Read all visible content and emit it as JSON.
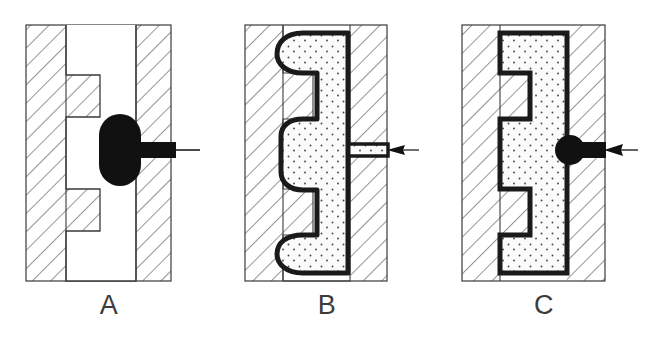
{
  "figure": {
    "title": "Injection molding cavity filling sequence",
    "width": 653,
    "height": 338,
    "background_color": "#ffffff",
    "panel_count": 3
  },
  "style": {
    "outline_color": "#1a1a1a",
    "mold_hatch_color": "#555555",
    "mold_fill_color": "#ffffff",
    "cavity_fill_color": "#ffffff",
    "melt_solid_color": "#111111",
    "part_fill_color": "#fbfbfb",
    "stipple_color": "#4a4a4a",
    "caption_color": "#3c3c3c",
    "mold_border_color": "#3a3a3a",
    "part_outline_width_px": 5,
    "mold_border_width_px": 1.2,
    "hatch_spacing_px": 13,
    "hatch_angle_deg": 45
  },
  "panels": [
    {
      "id": "a",
      "caption": "A",
      "state": "start-of-injection",
      "mold_box": {
        "x": 26,
        "y": 25,
        "width": 145,
        "height": 256
      },
      "parting_line_x": 66,
      "cavity_outline_points": "66,25 66,75 100,75 100,117 66,117 66,189 100,189 100,231 66,231 66,281 136,281 136,231 136,189 136,117 136,75 136,25",
      "cavity_description": "Empty Z-shaped (bracket) cavity, shown white and unfilled",
      "melt": {
        "shape": "capsule",
        "description": "Solid black slug of molten polymer entering the gate",
        "center_x": 120,
        "center_y": 150,
        "width": 42,
        "height": 72,
        "corner_radius": 21
      },
      "sprue": {
        "description": "Solid black sprue bar feeding melt from the right",
        "x": 120,
        "y": 142,
        "width": 56,
        "height": 16
      },
      "arrow": {
        "description": "Injection direction arrow pointing right",
        "tail_x": 200,
        "head_x": 152,
        "y": 150,
        "head_length": 18,
        "head_half_width": 5
      },
      "label": "A"
    },
    {
      "id": "b",
      "caption": "B",
      "state": "partial-fill-shrunken",
      "mold_box": {
        "x": 245,
        "y": 25,
        "width": 142,
        "height": 256
      },
      "parting_line_x": 283,
      "part_outline_points": "283,33 283,73 313,73 313,119 283,119 283,189 313,189 313,235 283,235 283,273 350,273 350,235 350,189 350,119 350,73 350,33",
      "part_description": "Stippled polymer that has filled the cavity only partially; rounded corners show it has pulled away from the mold walls",
      "corner_radius": 18,
      "gate": {
        "shape": "thin-channel",
        "description": "Narrow stippled gate channel at the right wall",
        "x": 350,
        "y": 144,
        "width": 36,
        "height": 12
      },
      "arrow": {
        "description": "Injection direction arrow pointing right",
        "tail_x": 416,
        "head_x": 388,
        "y": 150,
        "head_length": 16,
        "head_half_width": 4
      },
      "label": "B"
    },
    {
      "id": "c",
      "caption": "C",
      "state": "complete-fill",
      "mold_box": {
        "x": 462,
        "y": 25,
        "width": 143,
        "height": 256
      },
      "parting_line_x": 500,
      "part_outline_points": "500,33 500,73 530,73 530,119 500,119 500,189 530,189 530,235 500,235 500,273 567,273 567,235 567,189 567,119 567,73 567,33",
      "part_description": "Stippled polymer completely filling the Z-shaped cavity with sharp, fully formed corners",
      "corner_radius": 0,
      "gate": {
        "shape": "circle-plus-bar",
        "description": "Solid black round gate with feed bar at the right wall",
        "circle_center_x": 570,
        "circle_center_y": 150,
        "circle_radius": 15,
        "bar_x": 570,
        "bar_y": 142,
        "bar_width": 38,
        "bar_height": 16
      },
      "arrow": {
        "description": "Injection direction arrow pointing right",
        "tail_x": 636,
        "head_x": 604,
        "y": 150,
        "head_length": 17,
        "head_half_width": 5
      },
      "label": "C"
    }
  ],
  "captions": {
    "a": "A",
    "b": "B",
    "c": "C"
  }
}
